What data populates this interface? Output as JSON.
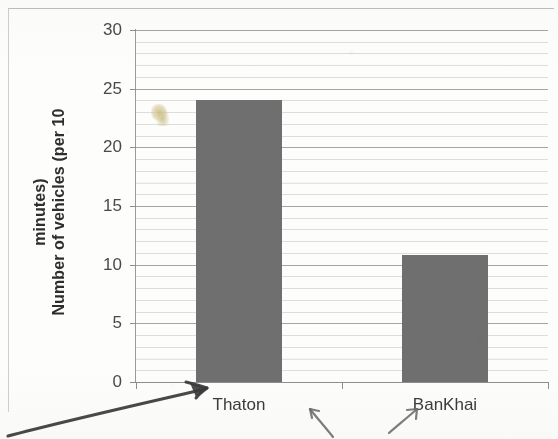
{
  "chart_data": {
    "type": "bar",
    "title": "",
    "subtitle": "",
    "xlabel": "",
    "ylabel": "Number of vehicles (per 10 minutes)",
    "ylabel_lines": [
      "Number of vehicles (per 10",
      "minutes)"
    ],
    "categories": [
      "Thaton",
      "BanKhai"
    ],
    "values": [
      24,
      10.8
    ],
    "ylim": [
      0,
      30
    ],
    "ytick_labels": [
      "0",
      "5",
      "10",
      "15",
      "20",
      "25",
      "30"
    ],
    "ytick_values": [
      0,
      5,
      10,
      15,
      20,
      25,
      30
    ],
    "minor_tick_step": 1,
    "grid": true,
    "grid_orientation": "horizontal",
    "legend": null,
    "legend_position": "none",
    "bar_color": "#6f6f6f",
    "gridline_color": "#a9a9a9",
    "minor_gridline_color": "#e4e4e4",
    "axis_color": "#8e8e8e",
    "background_color": "#fdfdfc"
  },
  "annotations": {
    "marks": [
      {
        "name": "arrow-to-thaton-bar",
        "kind": "handwritten-arrow",
        "direction": "up-right",
        "target": "Thaton",
        "color": "#3a3a3a"
      },
      {
        "name": "arrow-between-bars",
        "kind": "handwritten-arrow",
        "direction": "up-left",
        "target": "Thaton",
        "color": "#6a6a6a"
      },
      {
        "name": "arrow-to-bankhai-label",
        "kind": "handwritten-arrow",
        "direction": "up-right",
        "target": "BanKhai",
        "color": "#6a6a6a"
      }
    ],
    "smudge": {
      "name": "yellow-highlighter-smudge",
      "color": "#cebA74"
    }
  }
}
